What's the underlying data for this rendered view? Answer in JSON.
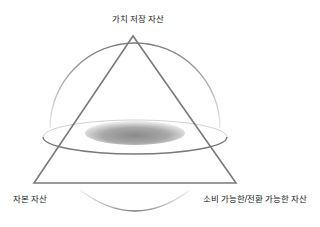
{
  "diagram": {
    "labels": {
      "top_vertex": "가치 저장 자산",
      "bottom_left_vertex": "자본 자산",
      "bottom_right_vertex": "소비 가능한/전환 가능한 자산"
    },
    "shapes": {
      "triangle": "triangle-outline",
      "sphere": "sphere-outline",
      "equator_ring": "orbit-ring",
      "core_shadow": "shaded-ellipse"
    },
    "colors": {
      "stroke": "#7a7a7a",
      "shadow_dark": "#8a8a8a",
      "shadow_light": "#e6e6e6",
      "text": "#222222"
    }
  }
}
